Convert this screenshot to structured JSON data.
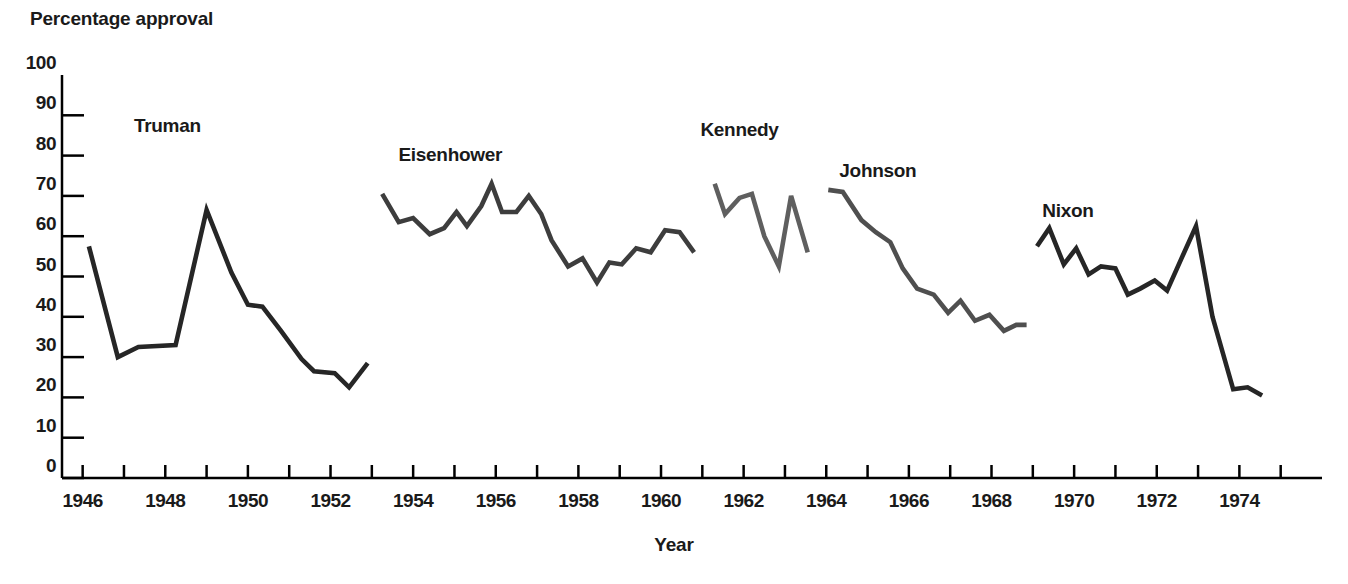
{
  "chart_data": {
    "type": "line",
    "title": "",
    "ylabel": "Percentage approval",
    "xlabel": "Year",
    "ylim": [
      0,
      100
    ],
    "xlim": [
      1945.5,
      1976.0
    ],
    "ytick_values": [
      0,
      10,
      20,
      30,
      40,
      50,
      60,
      70,
      80,
      90,
      100
    ],
    "ytick_labels": [
      "0",
      "10",
      "20",
      "30",
      "40",
      "50",
      "60",
      "70",
      "80",
      "90",
      "100"
    ],
    "xtick_labels": [
      "1946",
      "1948",
      "1950",
      "1952",
      "1954",
      "1956",
      "1958",
      "1960",
      "1962",
      "1964",
      "1966",
      "1968",
      "1970",
      "1972",
      "1974"
    ],
    "xtick_values": [
      1946,
      1948,
      1950,
      1952,
      1954,
      1956,
      1958,
      1960,
      1962,
      1964,
      1966,
      1968,
      1970,
      1972,
      1974
    ],
    "xminor_ticks": [
      1946,
      1947,
      1948,
      1949,
      1950,
      1951,
      1952,
      1953,
      1954,
      1955,
      1956,
      1957,
      1958,
      1959,
      1960,
      1961,
      1962,
      1963,
      1964,
      1965,
      1966,
      1967,
      1968,
      1969,
      1970,
      1971,
      1972,
      1973,
      1974,
      1975
    ],
    "grid": false,
    "legend_position": "inline-annotations",
    "series": [
      {
        "name": "Truman",
        "color": "#262626",
        "label_x": 1948.05,
        "label_y": 87,
        "x": [
          1946.15,
          1946.85,
          1947.35,
          1948.25,
          1949.0,
          1949.6,
          1950.0,
          1950.35,
          1950.8,
          1951.3,
          1951.6,
          1952.1,
          1952.45,
          1952.9
        ],
        "y": [
          57.5,
          30.0,
          32.5,
          33.0,
          66.5,
          51.0,
          43.0,
          42.5,
          36.5,
          29.5,
          26.5,
          26.0,
          22.5,
          28.5
        ]
      },
      {
        "name": "Eisenhower",
        "color": "#3d3d3d",
        "label_x": 1954.9,
        "label_y": 80,
        "x": [
          1953.25,
          1953.65,
          1954.0,
          1954.4,
          1954.75,
          1955.05,
          1955.3,
          1955.65,
          1955.9,
          1956.15,
          1956.5,
          1956.8,
          1957.1,
          1957.35,
          1957.75,
          1958.1,
          1958.45,
          1958.75,
          1959.05,
          1959.4,
          1959.75,
          1960.1,
          1960.45,
          1960.8
        ],
        "y": [
          70.5,
          63.5,
          64.5,
          60.5,
          62.0,
          66.0,
          62.5,
          67.5,
          73.0,
          66.0,
          66.0,
          70.0,
          65.5,
          59.0,
          52.5,
          54.5,
          48.5,
          53.5,
          53.0,
          57.0,
          56.0,
          61.5,
          61.0,
          56.0
        ]
      },
      {
        "name": "Kennedy",
        "color": "#5f5f5f",
        "label_x": 1961.9,
        "label_y": 86,
        "x": [
          1961.3,
          1961.55,
          1961.9,
          1962.2,
          1962.5,
          1962.85,
          1963.15,
          1963.55
        ],
        "y": [
          73.0,
          65.5,
          69.5,
          70.5,
          60.0,
          52.5,
          70.0,
          56.0
        ]
      },
      {
        "name": "Johnson",
        "color": "#4f4f4f",
        "label_x": 1965.25,
        "label_y": 76,
        "x": [
          1964.05,
          1964.4,
          1964.85,
          1965.2,
          1965.55,
          1965.85,
          1966.2,
          1966.6,
          1966.95,
          1967.25,
          1967.6,
          1967.95,
          1968.3,
          1968.6,
          1968.85
        ],
        "y": [
          71.5,
          71.0,
          64.0,
          61.0,
          58.5,
          52.0,
          47.0,
          45.5,
          41.0,
          44.0,
          39.0,
          40.5,
          36.5,
          38.0,
          38.0
        ]
      },
      {
        "name": "Nixon",
        "color": "#262626",
        "label_x": 1969.85,
        "label_y": 66,
        "x": [
          1969.1,
          1969.4,
          1969.75,
          1970.05,
          1970.35,
          1970.65,
          1971.0,
          1971.3,
          1971.6,
          1971.95,
          1972.25,
          1972.6,
          1972.95,
          1973.35,
          1973.85,
          1974.2,
          1974.55
        ],
        "y": [
          57.5,
          62.0,
          53.0,
          57.0,
          50.5,
          52.5,
          52.0,
          45.5,
          47.0,
          49.0,
          46.5,
          54.5,
          62.5,
          40.0,
          22.0,
          22.5,
          20.5
        ]
      }
    ]
  }
}
